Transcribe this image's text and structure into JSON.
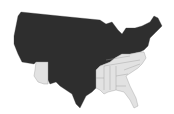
{
  "map": {
    "title": "United States",
    "legend": [
      {
        "label": "dark",
        "color": "#2e2e2e"
      },
      {
        "label": "light",
        "color": "#e2e2e2"
      }
    ],
    "light_states": [
      "Arizona",
      "Arkansas",
      "Louisiana",
      "Mississippi",
      "Alabama",
      "Georgia",
      "Florida",
      "South Carolina",
      "North Carolina",
      "Tennessee",
      "Kentucky",
      "Virginia"
    ],
    "dark_color": "#2e2e2e",
    "light_color": "#e2e2e2"
  }
}
